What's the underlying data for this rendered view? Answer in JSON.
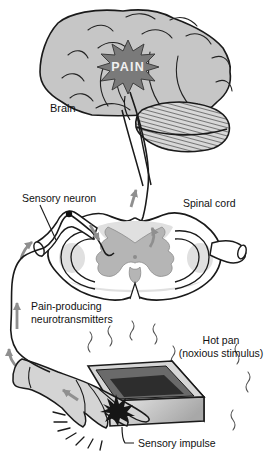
{
  "diagram": {
    "labels": {
      "brain": "Brain",
      "pain": "PAIN",
      "sensory_neuron": "Sensory neuron",
      "spinal_cord": "Spinal cord",
      "neurotransmitters_line1": "Pain-producing",
      "neurotransmitters_line2": "neurotransmitters",
      "hot_pan_line1": "Hot pan",
      "hot_pan_line2": "(noxious stimulus)",
      "sensory_impulse": "Sensory impulse"
    },
    "colors": {
      "background": "#ffffff",
      "outline": "#1a1a1a",
      "brain_fill": "#c6c6c6",
      "pain_starburst": "#7a7a7a",
      "pain_text": "#f0f0f0",
      "spinal_cord_white_matter": "#ffffff",
      "white_matter_shading": "#e0e0e0",
      "gray_matter": "#b5b5b5",
      "impulse_arrow": "#8f8f8f",
      "hand_fill": "#d4d4d4",
      "pan_rim": "#d6d6d6",
      "pan_inner_wall": "#6a6a6a",
      "pan_inner_bottom": "#2d2d2d",
      "pan_front_light": "#ececec",
      "pan_front_dark": "#a8a8a8"
    }
  }
}
